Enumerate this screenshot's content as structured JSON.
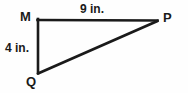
{
  "figure": {
    "kind": "geometry-diagram",
    "shape": "right-triangle",
    "background_color": "#fefefe",
    "stroke_color": "#1a1a1a",
    "text_color": "#1a1a1a",
    "vertices": [
      {
        "name": "M",
        "label": "M",
        "x": 38,
        "y": 20
      },
      {
        "name": "P",
        "label": "P",
        "x": 157,
        "y": 21
      },
      {
        "name": "Q",
        "label": "Q",
        "x": 38,
        "y": 73
      }
    ],
    "sides": [
      {
        "name": "MP",
        "label": "9 in.",
        "measure": 9,
        "unit": "in.",
        "from": "M",
        "to": "P"
      },
      {
        "name": "MQ",
        "label": "4 in.",
        "measure": 4,
        "unit": "in.",
        "from": "M",
        "to": "Q"
      },
      {
        "name": "QP",
        "label": "",
        "from": "Q",
        "to": "P"
      }
    ]
  }
}
